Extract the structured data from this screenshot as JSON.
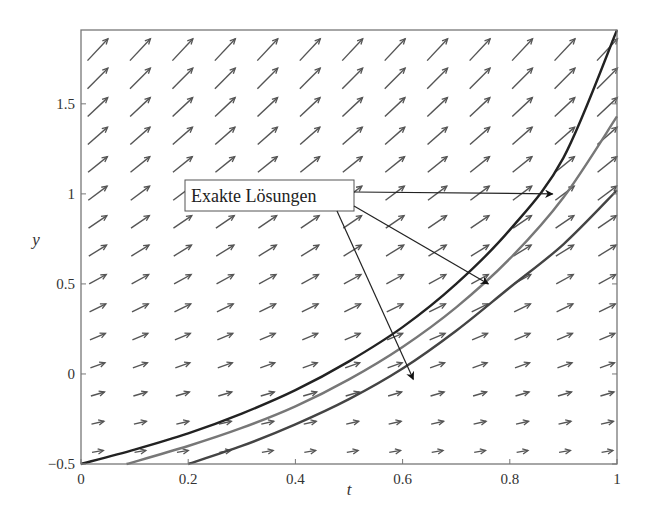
{
  "chart_data": {
    "type": "line",
    "title": "",
    "xlabel": "t",
    "ylabel": "y",
    "xlim": [
      0,
      1
    ],
    "ylim": [
      -0.5,
      1.91
    ],
    "grid": false,
    "xticks": [
      0,
      0.2,
      0.4,
      0.6,
      0.8,
      1
    ],
    "xtick_labels": [
      "0",
      "0.2",
      "0.4",
      "0.6",
      "0.8",
      "1"
    ],
    "yticks": [
      -0.5,
      0,
      0.5,
      1,
      1.5
    ],
    "ytick_labels": [
      "−0.5",
      "0",
      "0.5",
      "1",
      "1.5"
    ],
    "direction_field": {
      "t_count": 13,
      "y_count": 16,
      "color": "#555555"
    },
    "series": [
      {
        "name": "Exakte Lösung 1",
        "color": "#222222",
        "x": [
          0,
          0.1,
          0.2,
          0.3,
          0.4,
          0.5,
          0.6,
          0.7,
          0.8,
          0.9,
          1.0
        ],
        "y": [
          -0.5,
          -0.42,
          -0.33,
          -0.22,
          -0.09,
          0.07,
          0.26,
          0.5,
          0.8,
          1.2,
          1.91
        ]
      },
      {
        "name": "Exakte Lösung 2",
        "color": "#777777",
        "x": [
          0.085,
          0.2,
          0.3,
          0.4,
          0.5,
          0.6,
          0.7,
          0.8,
          0.9,
          1.0
        ],
        "y": [
          -0.5,
          -0.4,
          -0.3,
          -0.18,
          -0.03,
          0.15,
          0.37,
          0.64,
          0.98,
          1.43
        ]
      },
      {
        "name": "Exakte Lösung 3",
        "color": "#444444",
        "x": [
          0.2,
          0.3,
          0.4,
          0.5,
          0.6,
          0.7,
          0.8,
          0.9,
          1.0
        ],
        "y": [
          -0.5,
          -0.4,
          -0.28,
          -0.14,
          0.03,
          0.24,
          0.48,
          0.72,
          1.02
        ]
      }
    ],
    "annotation": {
      "text": "Exakte Lösungen",
      "arrows_to": [
        [
          0.88,
          1.0
        ],
        [
          0.76,
          0.5
        ],
        [
          0.62,
          -0.03
        ]
      ]
    }
  }
}
